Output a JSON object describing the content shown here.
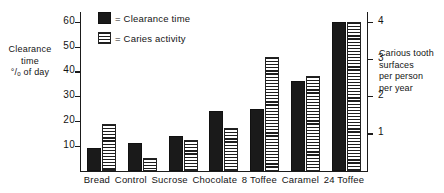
{
  "chart_data": {
    "type": "bar",
    "title": "",
    "categories": [
      "Bread",
      "Control",
      "Sucrose",
      "Chocolate",
      "8 Toffee",
      "Caramel",
      "24 Toffee"
    ],
    "series": [
      {
        "name": "Clearance time",
        "axis": "left",
        "values": [
          9,
          11,
          14,
          24,
          25,
          36,
          60
        ]
      },
      {
        "name": "Caries activity",
        "axis": "right",
        "values": [
          19,
          5,
          12.5,
          17,
          46,
          38,
          60
        ]
      }
    ],
    "xlabel": "",
    "ylabel": "Clearance time % of day",
    "ylabel_right": "Carious tooth surfaces per person per year",
    "ylim": [
      0,
      64
    ],
    "yticks": [
      10,
      20,
      30,
      40,
      50,
      60
    ],
    "ylim_right": [
      0,
      4.267
    ],
    "yticks_right": [
      1,
      2,
      3,
      4
    ],
    "grid": false,
    "legend_position": "top-left-inside"
  },
  "axes": {
    "left": {
      "title_lines": [
        "Clearance",
        "time",
        "°/ₒ of day"
      ],
      "ticks": [
        "60",
        "50",
        "40",
        "30",
        "20",
        "10"
      ],
      "tick_values": [
        60,
        50,
        40,
        30,
        20,
        10
      ]
    },
    "right": {
      "title_lines": [
        "Carious tooth",
        "surfaces",
        "per person",
        "per year"
      ],
      "ticks": [
        "4",
        "3",
        "2",
        "1"
      ],
      "tick_values": [
        4,
        3,
        2,
        1
      ]
    }
  },
  "legend": {
    "items": [
      {
        "label": "= Clearance time",
        "swatch": "solid-black"
      },
      {
        "label": "= Caries activity",
        "swatch": "horizontal-hatch"
      }
    ]
  },
  "categories": [
    {
      "label": "Bread"
    },
    {
      "label": "Control"
    },
    {
      "label": "Sucrose"
    },
    {
      "label": "Chocolate"
    },
    {
      "label": "8 Toffee"
    },
    {
      "label": "Caramel"
    },
    {
      "label": "24 Toffee"
    }
  ],
  "colors": {
    "clearance_bar": "#1a1a1a",
    "caries_bar_line": "#1d1d1d",
    "caries_bar_fill": "#ffffff",
    "axis": "#1b1b1b",
    "text": "#141414",
    "background": "#ffffff"
  }
}
